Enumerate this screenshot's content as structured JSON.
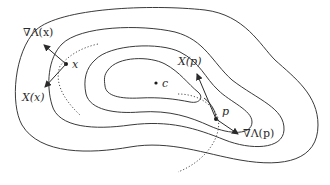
{
  "diagram": {
    "type": "level-set contour diagram",
    "labels": {
      "grad_x": "∇Λ(x)",
      "point_x": "x",
      "field_x": "X(x)",
      "center": "c",
      "field_p": "X(p)",
      "point_p": "p",
      "grad_p": "∇Λ(p)"
    },
    "contours": 4,
    "colors": {
      "stroke": "#3a3a3a",
      "text": "#2a2a2a",
      "background": "#ffffff"
    }
  }
}
